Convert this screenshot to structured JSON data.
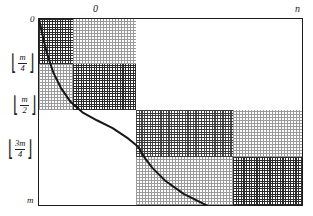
{
  "figure": {
    "kind": "recursive-matrix-partition-diagram",
    "axes": {
      "top_left_label": "0",
      "top_right_label": "n",
      "left_top_label": "0",
      "left_bottom_label": "m",
      "y_ticks": [
        {
          "id": "m-over-4",
          "numerator": "m",
          "denominator": "4",
          "bracket_left": "⌊",
          "bracket_right": "⌋"
        },
        {
          "id": "m-over-2",
          "numerator": "m",
          "denominator": "2",
          "bracket_left": "⌊",
          "bracket_right": "⌋"
        },
        {
          "id": "three-m-over-4",
          "numerator": "3m",
          "denominator": "4",
          "bracket_left": "⌊",
          "bracket_right": "⌋"
        }
      ]
    }
  },
  "chart_data": {
    "type": "line",
    "title": "",
    "xlabel": "",
    "ylabel": "",
    "xlim": [
      0,
      1
    ],
    "ylim": [
      0,
      1
    ],
    "x_tick_labels": [
      "0",
      "n"
    ],
    "y_tick_labels": [
      "0",
      "m/4",
      "m/2",
      "3m/4",
      "m"
    ],
    "grid": false,
    "legend": null,
    "series": [
      {
        "name": "boundary-curve",
        "x": [
          0.0,
          0.012,
          0.03,
          0.055,
          0.085,
          0.12,
          0.165,
          0.22,
          0.28,
          0.34,
          0.37,
          0.38,
          0.385,
          0.4,
          0.43,
          0.48,
          0.55,
          0.63,
          0.72,
          0.8,
          0.87,
          0.92,
          0.955,
          0.978,
          0.99,
          1.0
        ],
        "y": [
          0.0,
          0.055,
          0.13,
          0.205,
          0.265,
          0.315,
          0.355,
          0.385,
          0.415,
          0.455,
          0.48,
          0.49,
          0.5,
          0.525,
          0.565,
          0.615,
          0.665,
          0.705,
          0.745,
          0.785,
          0.825,
          0.865,
          0.905,
          0.945,
          0.975,
          1.0
        ]
      }
    ],
    "blocks": [
      {
        "id": "q1-dark",
        "x": 0.0,
        "y": 0.0,
        "w": 0.128,
        "h": 0.24,
        "shade": "dark"
      },
      {
        "id": "q1-light-right",
        "x": 0.128,
        "y": 0.0,
        "w": 0.24,
        "h": 0.24,
        "shade": "light"
      },
      {
        "id": "q1-light-below",
        "x": 0.0,
        "y": 0.24,
        "w": 0.128,
        "h": 0.25,
        "shade": "light"
      },
      {
        "id": "q1-dark-inner",
        "x": 0.128,
        "y": 0.24,
        "w": 0.24,
        "h": 0.25,
        "shade": "dark"
      },
      {
        "id": "q2-blank",
        "x": 0.368,
        "y": 0.0,
        "w": 0.632,
        "h": 0.49,
        "shade": "none"
      },
      {
        "id": "q3-blank",
        "x": 0.0,
        "y": 0.49,
        "w": 0.368,
        "h": 0.51,
        "shade": "none"
      },
      {
        "id": "q4-mid",
        "x": 0.368,
        "y": 0.49,
        "w": 0.37,
        "h": 0.25,
        "shade": "mid"
      },
      {
        "id": "q4-light-right",
        "x": 0.738,
        "y": 0.49,
        "w": 0.262,
        "h": 0.25,
        "shade": "light"
      },
      {
        "id": "q4-light-below",
        "x": 0.368,
        "y": 0.74,
        "w": 0.37,
        "h": 0.26,
        "shade": "light"
      },
      {
        "id": "q4-dark-inner",
        "x": 0.738,
        "y": 0.74,
        "w": 0.262,
        "h": 0.26,
        "shade": "dark"
      }
    ]
  },
  "colors": {
    "frame": "#1c1c1c",
    "curve": "#171717",
    "dark_dither": "#2b2b2b",
    "light_dither": "#9a9a9a",
    "background": "#ffffff"
  }
}
